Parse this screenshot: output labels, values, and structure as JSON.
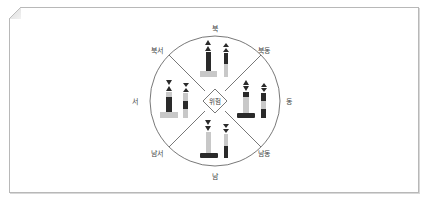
{
  "diagram": {
    "title": "",
    "center_label": "위험",
    "directions": {
      "north": "북",
      "northeast": "북동",
      "east": "동",
      "southeast": "남동",
      "south": "남",
      "southwest": "남서",
      "west": "서",
      "northwest": "북서"
    },
    "marks": [
      {
        "quadrant": "north",
        "topmark": "two cones pointing up",
        "bands": [
          "black",
          "yellow"
        ]
      },
      {
        "quadrant": "east",
        "topmark": "two cones base to base",
        "bands": [
          "black",
          "yellow",
          "black"
        ]
      },
      {
        "quadrant": "south",
        "topmark": "two cones pointing down",
        "bands": [
          "yellow",
          "black"
        ]
      },
      {
        "quadrant": "west",
        "topmark": "two cones point to point",
        "bands": [
          "yellow",
          "black",
          "yellow"
        ]
      }
    ],
    "colors": {
      "dark": "#2a2a2a",
      "light": "#c8c8c8",
      "line": "#555555"
    }
  }
}
